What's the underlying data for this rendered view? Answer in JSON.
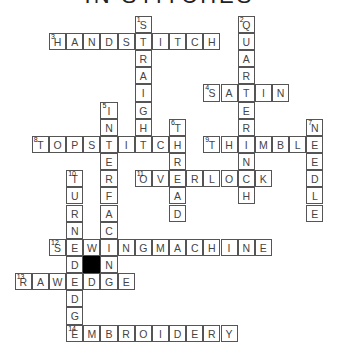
{
  "title": "IN STITCHES",
  "grid": {
    "origin_x": 14.7,
    "origin_y": 15.85,
    "cell": 17.15
  },
  "words": [
    {
      "number": 1,
      "answer": "STRAIGHT",
      "direction": "down",
      "row": 0,
      "col": 7
    },
    {
      "number": 2,
      "answer": "QUARTERINCH",
      "direction": "down",
      "row": 0,
      "col": 13
    },
    {
      "number": 3,
      "answer": "HANDSTITCH",
      "direction": "across",
      "row": 1,
      "col": 2
    },
    {
      "number": 4,
      "answer": "SATIN",
      "direction": "across",
      "row": 4,
      "col": 11
    },
    {
      "number": 5,
      "answer": "INTERFACING",
      "direction": "down",
      "row": 5,
      "col": 5
    },
    {
      "number": 6,
      "answer": "THREAD",
      "direction": "down",
      "row": 6,
      "col": 9
    },
    {
      "number": 7,
      "answer": "NEEDLE",
      "direction": "down",
      "row": 6,
      "col": 17
    },
    {
      "number": 8,
      "answer": "TOPSTITCH",
      "direction": "across",
      "row": 7,
      "col": 1
    },
    {
      "number": 9,
      "answer": "THIMBLE",
      "direction": "across",
      "row": 7,
      "col": 11
    },
    {
      "number": 10,
      "answer": "TURNEDEDGE",
      "direction": "down",
      "row": 9,
      "col": 3
    },
    {
      "number": 11,
      "answer": "OVERLOCK",
      "direction": "across",
      "row": 9,
      "col": 7
    },
    {
      "number": 12,
      "answer": "SEWINGMACHINE",
      "direction": "across",
      "row": 13,
      "col": 2
    },
    {
      "number": 13,
      "answer": "RAWEDGE",
      "direction": "across",
      "row": 15,
      "col": 0
    },
    {
      "number": 14,
      "answer": "EMBROIDERY",
      "direction": "across",
      "row": 18,
      "col": 3
    }
  ],
  "black_cells": [
    {
      "row": 14,
      "col": 4
    }
  ]
}
